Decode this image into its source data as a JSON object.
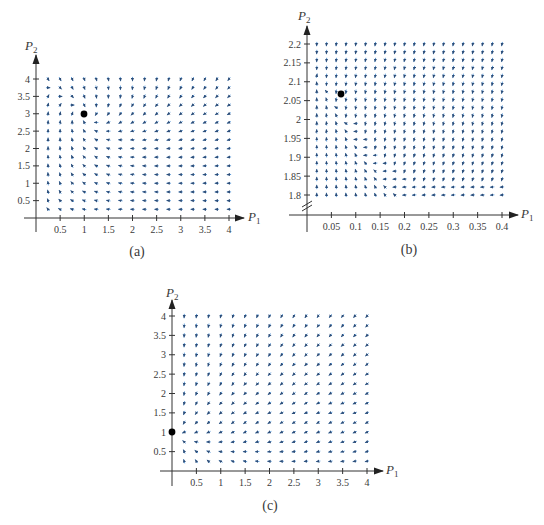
{
  "colors": {
    "arrow": "#4a8fd4",
    "arrowhead": "#2c4d78",
    "axis": "#333333",
    "point": "#000000"
  },
  "chart_data": [
    {
      "type": "quiver",
      "caption": "(a)",
      "xlabel": "P1",
      "ylabel": "P2",
      "xlim": [
        0,
        4
      ],
      "ylim": [
        0,
        4
      ],
      "xticks": [
        "0.5",
        "1",
        "1.5",
        "2",
        "2.5",
        "3",
        "3.5",
        "4"
      ],
      "yticks": [
        "0.5",
        "1",
        "1.5",
        "2",
        "2.5",
        "3",
        "3.5",
        "4"
      ],
      "grid": {
        "x_start": 0.25,
        "x_end": 4,
        "y_start": 0.25,
        "y_end": 4,
        "n": 16
      },
      "equilibrium": [
        1,
        3
      ],
      "field_description": "arrows point up near P1≈0, right near top above equilibrium, down-left in upper right, left along bottom; spiral around (1,3)"
    },
    {
      "type": "quiver",
      "caption": "(b)",
      "xlabel": "P1",
      "ylabel": "P2",
      "xlim": [
        0,
        0.4
      ],
      "ylim": [
        1.8,
        2.2
      ],
      "axis_break_y": true,
      "xticks": [
        "0.05",
        "0.1",
        "0.15",
        "0.2",
        "0.25",
        "0.3",
        "0.35",
        "0.4"
      ],
      "yticks": [
        "1.8",
        "1.85",
        "1.9",
        "1.95",
        "2",
        "2.05",
        "2.1",
        "2.15",
        "2.2"
      ],
      "grid": {
        "x_start": 0.02,
        "x_end": 0.4,
        "y_start": 1.8,
        "y_end": 2.2,
        "n": 20
      },
      "equilibrium": [
        0.067,
        2.07
      ],
      "field_description": "arrows point up to the left of a curved nullcline running from (0.08,2.0) to (0.22,1.8); down and down-left to the right of it"
    },
    {
      "type": "quiver",
      "caption": "(c)",
      "xlabel": "P1",
      "ylabel": "P2",
      "xlim": [
        0,
        4
      ],
      "ylim": [
        0,
        4
      ],
      "xticks": [
        "0.5",
        "1",
        "1.5",
        "2",
        "2.5",
        "3",
        "3.5",
        "4"
      ],
      "yticks": [
        "0.5",
        "1",
        "1.5",
        "2",
        "2.5",
        "3",
        "3.5",
        "4"
      ],
      "grid": {
        "x_start": 0.25,
        "x_end": 4,
        "y_start": 0.25,
        "y_end": 4,
        "n": 16
      },
      "equilibrium": [
        0,
        1
      ],
      "field_description": "all arrows flow toward (0,1): downward at top, down-left in the middle, leftward at bottom"
    }
  ],
  "panels": {
    "a": {
      "caption": "(a)",
      "xlabel": "P",
      "xsub": "1",
      "ylabel": "P",
      "ysub": "2"
    },
    "b": {
      "caption": "(b)",
      "xlabel": "P",
      "xsub": "1",
      "ylabel": "P",
      "ysub": "2"
    },
    "c": {
      "caption": "(c)",
      "xlabel": "P",
      "xsub": "1",
      "ylabel": "P",
      "ysub": "2"
    }
  }
}
